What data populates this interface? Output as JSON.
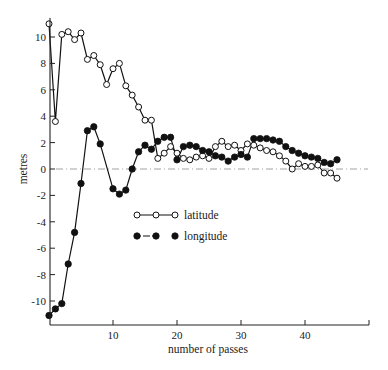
{
  "chart_data": {
    "type": "line",
    "title": "",
    "xlabel": "number of passes",
    "ylabel": "metres",
    "xlim": [
      0,
      50
    ],
    "ylim": [
      -12,
      11.5
    ],
    "xticks": [
      10,
      20,
      30,
      40
    ],
    "xtick_labels": [
      "10",
      "20",
      "30",
      "40"
    ],
    "yticks": [
      10,
      8,
      6,
      4,
      2,
      0,
      -2,
      -4,
      -6,
      -8,
      -10
    ],
    "ytick_labels": [
      "10",
      "8",
      "6",
      "4",
      "2",
      "0",
      "-2",
      "-4",
      "-6",
      "-8",
      "-10"
    ],
    "grid": false,
    "reference_line": {
      "y": 0,
      "style": "dash-dot"
    },
    "legend": {
      "position": "center",
      "entries": [
        "latitude",
        "longitude"
      ]
    },
    "series": [
      {
        "name": "latitude",
        "marker": "open-circle",
        "line": "solid",
        "x": [
          0,
          1,
          2,
          3,
          4,
          5,
          6,
          7,
          8,
          9,
          10,
          11,
          12,
          13,
          14,
          15,
          16,
          17,
          18,
          19,
          20,
          21,
          22,
          23,
          24,
          25,
          26,
          27,
          28,
          29,
          30,
          31,
          32,
          33,
          34,
          35,
          36,
          37,
          38,
          39,
          40,
          41,
          42,
          43,
          44,
          45
        ],
        "y": [
          11.0,
          3.6,
          10.2,
          10.4,
          9.8,
          10.3,
          8.3,
          8.6,
          7.9,
          6.4,
          7.6,
          8.0,
          6.3,
          5.6,
          4.7,
          3.7,
          3.7,
          0.8,
          1.2,
          1.7,
          1.2,
          0.8,
          0.7,
          0.9,
          1.0,
          0.8,
          1.7,
          2.1,
          1.7,
          1.8,
          1.4,
          1.9,
          1.8,
          1.6,
          1.4,
          1.3,
          1.0,
          0.6,
          0.0,
          0.4,
          0.2,
          0.2,
          0.3,
          -0.3,
          -0.3,
          -0.7
        ]
      },
      {
        "name": "longitude",
        "marker": "filled-circle",
        "line": "solid",
        "x": [
          0,
          1,
          2,
          3,
          4,
          5,
          6,
          7,
          8,
          10,
          11,
          12,
          13,
          14,
          15,
          16,
          17,
          18,
          19,
          20,
          21,
          22,
          23,
          24,
          25,
          26,
          27,
          28,
          29,
          30,
          31,
          32,
          33,
          34,
          35,
          36,
          37,
          38,
          39,
          40,
          41,
          42,
          43,
          44,
          45
        ],
        "y": [
          -11.1,
          -10.6,
          -10.2,
          -7.2,
          -4.8,
          -1.1,
          2.9,
          3.2,
          1.9,
          -1.5,
          -1.9,
          -1.6,
          0.0,
          1.3,
          1.8,
          1.5,
          2.1,
          2.4,
          2.4,
          0.7,
          1.7,
          1.8,
          1.7,
          1.4,
          1.3,
          1.0,
          0.9,
          0.6,
          0.9,
          1.1,
          0.9,
          2.3,
          2.3,
          2.3,
          2.2,
          2.1,
          1.7,
          1.4,
          1.2,
          1.0,
          0.9,
          0.8,
          0.5,
          0.4,
          0.7
        ]
      }
    ]
  }
}
